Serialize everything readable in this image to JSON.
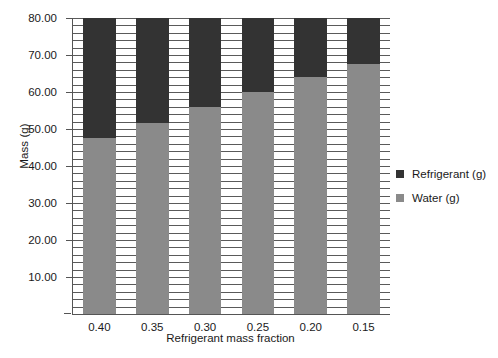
{
  "chart_data": {
    "type": "bar",
    "subtype": "stacked-vertical",
    "title": "",
    "xlabel": "Refrigerant mass fraction",
    "ylabel": "Mass (g)",
    "categories": [
      "0.40",
      "0.35",
      "0.30",
      "0.25",
      "0.20",
      "0.15"
    ],
    "series": [
      {
        "name": "Water (g)",
        "color": "#8a8a8a",
        "values": [
          47.5,
          51.7,
          56.0,
          60.0,
          64.0,
          67.5
        ]
      },
      {
        "name": "Refrigerant (g)",
        "color": "#333333",
        "values": [
          32.5,
          28.3,
          24.0,
          20.0,
          16.0,
          12.5
        ]
      }
    ],
    "stack_totals": [
      80.0,
      80.0,
      80.0,
      80.0,
      80.0,
      80.0
    ],
    "ylim": [
      0,
      80
    ],
    "ytick_values": [
      10,
      20,
      30,
      40,
      50,
      60,
      70,
      80
    ],
    "ytick_labels": [
      "10.00",
      "20.00",
      "30.00",
      "40.00",
      "50.00",
      "60.00",
      "70.00",
      "80.00"
    ],
    "ytick_step": 10,
    "minor_gridline_step": 2,
    "grid": true,
    "grid_orientation": "horizontal",
    "legend_position": "right",
    "legend_entries": [
      {
        "label": "Refrigerant (g)",
        "color": "#333333"
      },
      {
        "label": "Water (g)",
        "color": "#8a8a8a"
      }
    ],
    "axis_color": "#555555",
    "background": "#ffffff"
  }
}
